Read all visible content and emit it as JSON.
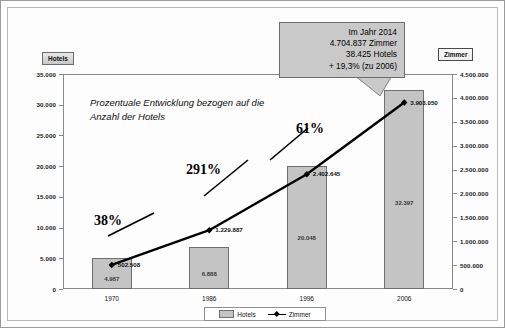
{
  "chart_data": {
    "type": "bar",
    "title": "",
    "categories": [
      "1970",
      "1986",
      "1996",
      "2006"
    ],
    "xlabel": "",
    "ylabel": "Hotels",
    "y2label": "Zimmer",
    "ylim": [
      0,
      35000
    ],
    "y2lim": [
      0,
      4500000
    ],
    "grid": false,
    "legend_position": "bottom",
    "series": [
      {
        "name": "Hotels",
        "type": "bar",
        "axis": "left",
        "values": [
          4987,
          6888,
          20048,
          32397
        ],
        "value_labels": [
          "4.987",
          "6.888",
          "20.048",
          "32.397"
        ]
      },
      {
        "name": "Zimmer",
        "type": "line",
        "axis": "right",
        "values": [
          502508,
          1229887,
          2402645,
          3903050
        ],
        "value_labels": [
          "502.508",
          "1.229.887",
          "2.402.645",
          "3.903.050"
        ]
      }
    ],
    "left_ticks": [
      "35.000",
      "30.000",
      "25.000",
      "20.000",
      "15.000",
      "10.000",
      "5.000",
      "0"
    ],
    "left_tick_values": [
      35000,
      30000,
      25000,
      20000,
      15000,
      10000,
      5000,
      0
    ],
    "right_ticks": [
      "4.500.000",
      "4.000.000",
      "3.500.000",
      "3.000.000",
      "2.500.000",
      "2.000.000",
      "1.500.000",
      "1.000.000",
      "500.000",
      "0"
    ],
    "right_tick_values": [
      4500000,
      4000000,
      3500000,
      3000000,
      2500000,
      2000000,
      1500000,
      1000000,
      500000,
      0
    ],
    "annotations": {
      "note": "Prozentuale Entwicklung bezogen auf die Anzahl der Hotels",
      "growth_labels": [
        "38%",
        "291%",
        "61%"
      ],
      "callout": [
        "Im Jahr 2014",
        "4.704.837 Zimmer",
        "38.425 Hotels",
        "+ 19,3% (zu 2006)"
      ]
    },
    "colors": {
      "bar_fill": "#c4c4c4",
      "bar_border": "#6f6f6f",
      "line": "#000000",
      "callout_bg": "#c9c9c9",
      "axis": "#8a8a8a"
    }
  },
  "axis_titles": {
    "left": "Hotels",
    "right": "Zimmer"
  },
  "legend": {
    "items": [
      {
        "label": "Hotels",
        "marker": "square-swatch"
      },
      {
        "label": "Zimmer",
        "marker": "line-diamond"
      }
    ]
  }
}
